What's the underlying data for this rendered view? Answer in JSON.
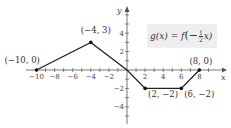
{
  "chart_data": {
    "type": "line",
    "title": "",
    "formula": "g(x) = f(−½x)",
    "xlabel": "x",
    "ylabel": "y",
    "xlim": [
      -11,
      9
    ],
    "ylim": [
      -5,
      5
    ],
    "grid": false,
    "x_ticks": [
      -10,
      -8,
      -6,
      -4,
      -2,
      2,
      4,
      6,
      8
    ],
    "x_tick_labels": [
      "−10",
      "−8",
      "−6",
      "−4",
      "−2",
      "2",
      "4",
      "6",
      "8"
    ],
    "y_ticks": [
      -4,
      -2,
      2,
      4
    ],
    "y_tick_labels": [
      "−4",
      "−2",
      "2",
      "4"
    ],
    "series": [
      {
        "name": "g(x)",
        "x": [
          -10,
          -4,
          0,
          2,
          6,
          8
        ],
        "y": [
          0,
          3,
          0,
          -2,
          -2,
          0
        ]
      }
    ],
    "points": [
      {
        "x": -10,
        "y": 0,
        "label": "(−10, 0)"
      },
      {
        "x": -4,
        "y": 3,
        "label": "(−4, 3)"
      },
      {
        "x": 2,
        "y": -2,
        "label": "(2, −2)"
      },
      {
        "x": 6,
        "y": -2,
        "label": "(6, −2)"
      },
      {
        "x": 8,
        "y": 0,
        "label": "(8, 0)"
      }
    ]
  },
  "formula_text": {
    "g": "g(x) = f",
    "arg": "(−",
    "num": "1",
    "den": "2",
    "x": "x)"
  }
}
